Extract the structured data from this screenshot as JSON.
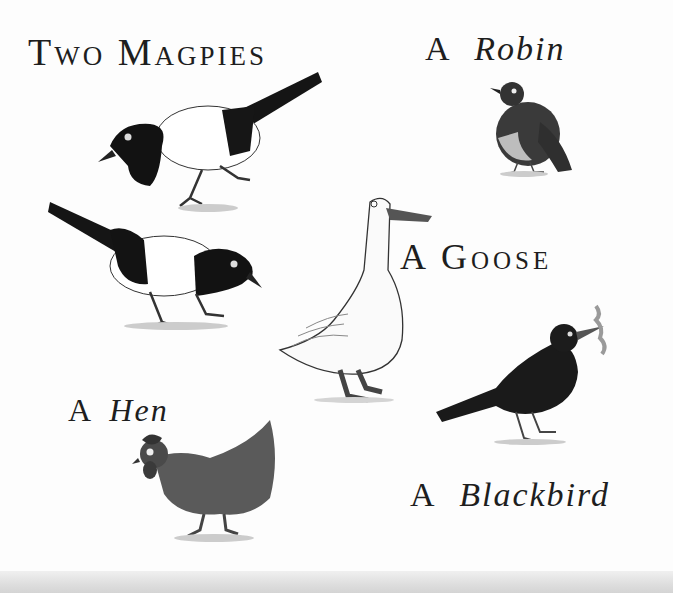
{
  "labels": {
    "magpies": "Two Magpies",
    "robin_a": "A",
    "robin": "Robin",
    "goose": "A Goose",
    "hen_a": "A",
    "hen": "Hen",
    "blackbird_a": "A",
    "blackbird": "Blackbird"
  },
  "birds": [
    {
      "name": "magpie-1",
      "colors": {
        "body": "#111111",
        "belly": "#ffffff"
      }
    },
    {
      "name": "magpie-2",
      "colors": {
        "body": "#111111",
        "belly": "#ffffff"
      }
    },
    {
      "name": "robin",
      "colors": {
        "body": "#3a3a3a",
        "belly": "#bdbdbd"
      }
    },
    {
      "name": "goose",
      "colors": {
        "body": "#fafafa",
        "beak": "#555555"
      }
    },
    {
      "name": "hen",
      "colors": {
        "body": "#5a5a5a"
      }
    },
    {
      "name": "blackbird",
      "colors": {
        "body": "#1a1a1a",
        "worm": "#9a9a9a"
      }
    }
  ]
}
